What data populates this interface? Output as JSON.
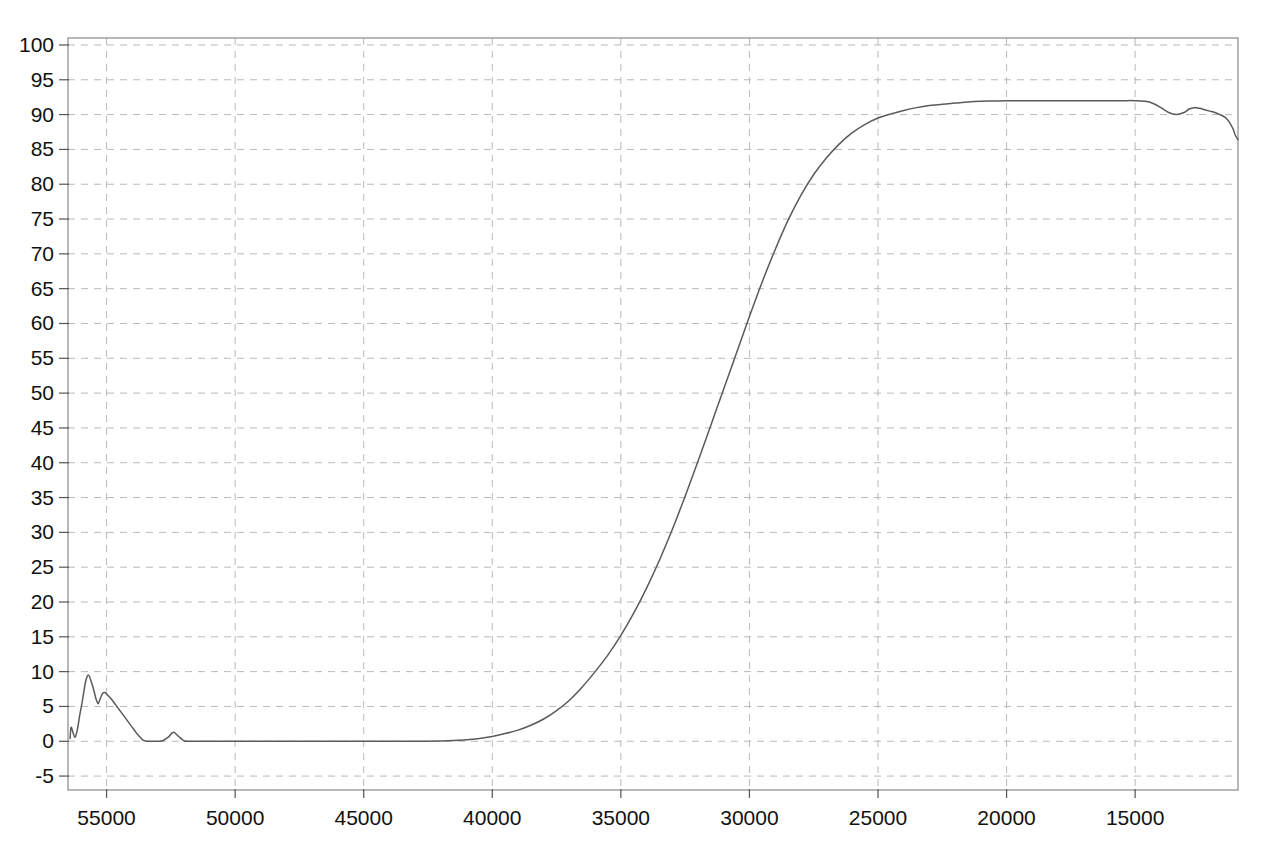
{
  "chart_data": {
    "type": "line",
    "title": "",
    "subtitle": "",
    "xlabel": "",
    "ylabel": "",
    "xlim": [
      56500,
      11000
    ],
    "ylim": [
      -7,
      101
    ],
    "x_axis_reversed": true,
    "grid": true,
    "legend": null,
    "legend_position": "none",
    "background_color": "#ffffff",
    "grid_color": "#b9b9b9",
    "axis_color": "#8a8a8a",
    "line_color": "#5a5a5a",
    "y_ticks": [
      100,
      95,
      90,
      85,
      80,
      75,
      70,
      65,
      60,
      55,
      50,
      45,
      40,
      35,
      30,
      25,
      20,
      15,
      10,
      5,
      0,
      -5
    ],
    "y_tick_labels": [
      "100",
      "95",
      "90",
      "85",
      "80",
      "75",
      "70",
      "65",
      "60",
      "55",
      "50",
      "45",
      "40",
      "35",
      "30",
      "25",
      "20",
      "15",
      "10",
      "5",
      "0",
      "-5"
    ],
    "x_ticks": [
      55000,
      50000,
      45000,
      40000,
      35000,
      30000,
      25000,
      20000,
      15000
    ],
    "x_tick_labels": [
      "55000",
      "50000",
      "45000",
      "40000",
      "35000",
      "30000",
      "25000",
      "20000",
      "15000"
    ],
    "series": [
      {
        "name": "transmittance",
        "color": "#5a5a5a",
        "x": [
          56420,
          56380,
          56300,
          56220,
          56130,
          56050,
          55960,
          55880,
          55800,
          55700,
          55600,
          55500,
          55420,
          55330,
          55250,
          55150,
          55060,
          54980,
          54900,
          54800,
          54700,
          54600,
          54500,
          54400,
          54300,
          54200,
          54100,
          54000,
          53900,
          53800,
          53700,
          53600,
          53500,
          53400,
          53300,
          53200,
          53100,
          53000,
          52800,
          52600,
          52400,
          52200,
          52000,
          51800,
          51000,
          50000,
          49000,
          48000,
          47000,
          46000,
          45000,
          44000,
          43000,
          42000,
          41500,
          41000,
          40500,
          40000,
          39500,
          39000,
          38500,
          38000,
          37500,
          37000,
          36500,
          36000,
          35500,
          35000,
          34500,
          34000,
          33500,
          33000,
          32500,
          32000,
          31500,
          31000,
          30500,
          30000,
          29500,
          29000,
          28500,
          28000,
          27500,
          27000,
          26500,
          26000,
          25500,
          25000,
          24500,
          24000,
          23500,
          23000,
          22500,
          22000,
          21500,
          21000,
          20500,
          20000,
          19500,
          19000,
          18500,
          18000,
          17500,
          17000,
          16500,
          16000,
          15500,
          15000,
          14600,
          14300,
          14000,
          13700,
          13400,
          13100,
          12900,
          12700,
          12500,
          12300,
          12100,
          11900,
          11700,
          11500,
          11350,
          11200,
          11100,
          11000
        ],
        "y": [
          0.4,
          2.0,
          1.2,
          0.6,
          1.8,
          3.6,
          5.4,
          7.2,
          8.8,
          9.5,
          8.6,
          7.4,
          6.2,
          5.4,
          6.1,
          6.9,
          7.0,
          6.7,
          6.4,
          6.0,
          5.5,
          5.0,
          4.5,
          4.0,
          3.5,
          3.0,
          2.5,
          2.0,
          1.5,
          1.0,
          0.6,
          0.2,
          0.05,
          0.0,
          0.0,
          0.0,
          0.0,
          0.0,
          0.1,
          0.6,
          1.3,
          0.7,
          0.1,
          0.0,
          0.0,
          0.0,
          0.0,
          0.0,
          0.0,
          0.0,
          0.0,
          0.0,
          0.0,
          0.05,
          0.1,
          0.2,
          0.4,
          0.7,
          1.1,
          1.6,
          2.3,
          3.2,
          4.4,
          5.9,
          7.8,
          10.0,
          12.4,
          15.2,
          18.4,
          22.0,
          26.0,
          30.4,
          35.2,
          40.2,
          45.4,
          50.6,
          55.8,
          61.0,
          66.0,
          70.6,
          74.8,
          78.4,
          81.4,
          83.8,
          85.8,
          87.4,
          88.6,
          89.5,
          90.1,
          90.6,
          91.0,
          91.3,
          91.5,
          91.65,
          91.8,
          91.9,
          91.95,
          92.0,
          92.0,
          92.0,
          92.0,
          92.0,
          92.0,
          92.0,
          92.0,
          92.0,
          92.0,
          92.0,
          91.9,
          91.6,
          91.0,
          90.3,
          90.0,
          90.3,
          90.8,
          91.0,
          90.9,
          90.7,
          90.5,
          90.3,
          90.0,
          89.6,
          89.0,
          88.0,
          87.0,
          86.4
        ]
      }
    ]
  }
}
